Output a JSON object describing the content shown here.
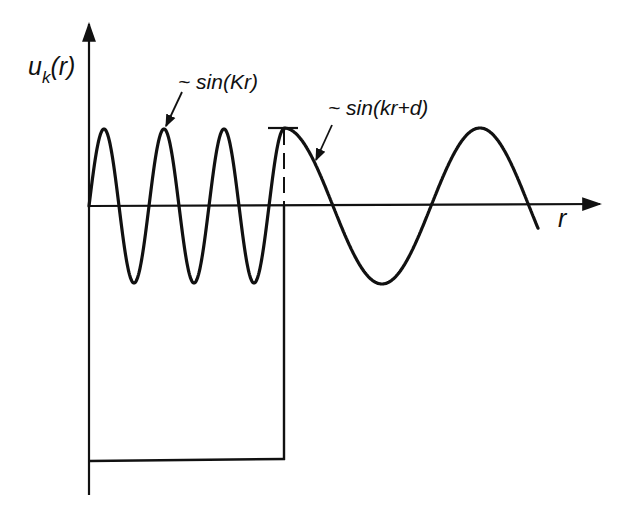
{
  "diagram": {
    "y_axis_label": {
      "main": "u",
      "subscript": "k",
      "arg": "(r)"
    },
    "x_axis_label": "r",
    "annotations": [
      {
        "id": "inner",
        "text": "~ sin(Kr)",
        "points_to": "inner oscillation (second peak)"
      },
      {
        "id": "outer",
        "text": "~ sin(kr+d)",
        "points_to": "outer oscillation (just past the boundary)"
      }
    ],
    "regions": [
      {
        "name": "inside well",
        "behavior": "sin(Kr)",
        "wavelength": "short",
        "peaks": 4
      },
      {
        "name": "outside well",
        "behavior": "sin(kr+d)",
        "wavelength": "long",
        "phase_shift": "d"
      }
    ],
    "potential_well": {
      "shape": "square well",
      "boundary": "dashed line above axis, solid below",
      "depth": "drawn as a rectangle below the axis"
    }
  }
}
